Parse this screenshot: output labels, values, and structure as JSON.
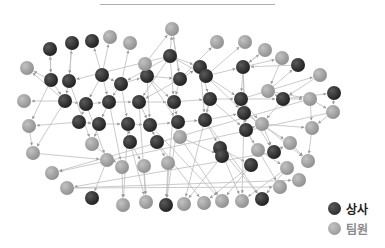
{
  "legend": {
    "items": [
      {
        "label": "상사",
        "color": "#2e2e2e"
      },
      {
        "label": "팀원",
        "color": "#a3a3a3"
      }
    ]
  },
  "colors": {
    "boss": "#2e2e2e",
    "team": "#a3a3a3",
    "edge": "#bdbdbd",
    "rule": "#b0b0b0"
  },
  "graph": {
    "node_radius": 7,
    "nodes": [
      {
        "x": 50,
        "y": 49,
        "t": "boss"
      },
      {
        "x": 72,
        "y": 43,
        "t": "boss"
      },
      {
        "x": 92,
        "y": 41,
        "t": "boss"
      },
      {
        "x": 110,
        "y": 37,
        "t": "team"
      },
      {
        "x": 130,
        "y": 43,
        "t": "team"
      },
      {
        "x": 172,
        "y": 29,
        "t": "team"
      },
      {
        "x": 217,
        "y": 42,
        "t": "team"
      },
      {
        "x": 245,
        "y": 42,
        "t": "team"
      },
      {
        "x": 265,
        "y": 50,
        "t": "team"
      },
      {
        "x": 282,
        "y": 58,
        "t": "team"
      },
      {
        "x": 298,
        "y": 65,
        "t": "boss"
      },
      {
        "x": 170,
        "y": 56,
        "t": "boss"
      },
      {
        "x": 27,
        "y": 68,
        "t": "team"
      },
      {
        "x": 51,
        "y": 80,
        "t": "boss"
      },
      {
        "x": 69,
        "y": 81,
        "t": "boss"
      },
      {
        "x": 102,
        "y": 75,
        "t": "boss"
      },
      {
        "x": 121,
        "y": 84,
        "t": "boss"
      },
      {
        "x": 147,
        "y": 76,
        "t": "boss"
      },
      {
        "x": 145,
        "y": 64,
        "t": "team"
      },
      {
        "x": 180,
        "y": 79,
        "t": "boss"
      },
      {
        "x": 200,
        "y": 67,
        "t": "boss"
      },
      {
        "x": 206,
        "y": 76,
        "t": "boss"
      },
      {
        "x": 243,
        "y": 67,
        "t": "boss"
      },
      {
        "x": 320,
        "y": 75,
        "t": "team"
      },
      {
        "x": 334,
        "y": 93,
        "t": "boss"
      },
      {
        "x": 24,
        "y": 101,
        "t": "team"
      },
      {
        "x": 65,
        "y": 101,
        "t": "boss"
      },
      {
        "x": 86,
        "y": 104,
        "t": "boss"
      },
      {
        "x": 109,
        "y": 102,
        "t": "boss"
      },
      {
        "x": 139,
        "y": 102,
        "t": "boss"
      },
      {
        "x": 174,
        "y": 102,
        "t": "boss"
      },
      {
        "x": 210,
        "y": 99,
        "t": "boss"
      },
      {
        "x": 241,
        "y": 99,
        "t": "boss"
      },
      {
        "x": 268,
        "y": 91,
        "t": "team"
      },
      {
        "x": 283,
        "y": 99,
        "t": "boss"
      },
      {
        "x": 310,
        "y": 99,
        "t": "team"
      },
      {
        "x": 333,
        "y": 112,
        "t": "team"
      },
      {
        "x": 29,
        "y": 126,
        "t": "team"
      },
      {
        "x": 79,
        "y": 122,
        "t": "boss"
      },
      {
        "x": 99,
        "y": 124,
        "t": "boss"
      },
      {
        "x": 128,
        "y": 124,
        "t": "boss"
      },
      {
        "x": 150,
        "y": 125,
        "t": "boss"
      },
      {
        "x": 178,
        "y": 122,
        "t": "boss"
      },
      {
        "x": 205,
        "y": 120,
        "t": "boss"
      },
      {
        "x": 244,
        "y": 113,
        "t": "boss"
      },
      {
        "x": 246,
        "y": 130,
        "t": "boss"
      },
      {
        "x": 262,
        "y": 124,
        "t": "team"
      },
      {
        "x": 312,
        "y": 128,
        "t": "team"
      },
      {
        "x": 33,
        "y": 153,
        "t": "team"
      },
      {
        "x": 92,
        "y": 144,
        "t": "team"
      },
      {
        "x": 130,
        "y": 142,
        "t": "boss"
      },
      {
        "x": 157,
        "y": 142,
        "t": "boss"
      },
      {
        "x": 180,
        "y": 137,
        "t": "team"
      },
      {
        "x": 220,
        "y": 148,
        "t": "boss"
      },
      {
        "x": 258,
        "y": 150,
        "t": "team"
      },
      {
        "x": 274,
        "y": 152,
        "t": "boss"
      },
      {
        "x": 290,
        "y": 143,
        "t": "team"
      },
      {
        "x": 308,
        "y": 161,
        "t": "team"
      },
      {
        "x": 52,
        "y": 173,
        "t": "team"
      },
      {
        "x": 107,
        "y": 160,
        "t": "team"
      },
      {
        "x": 122,
        "y": 167,
        "t": "team"
      },
      {
        "x": 144,
        "y": 166,
        "t": "team"
      },
      {
        "x": 168,
        "y": 163,
        "t": "team"
      },
      {
        "x": 222,
        "y": 156,
        "t": "boss"
      },
      {
        "x": 251,
        "y": 165,
        "t": "boss"
      },
      {
        "x": 287,
        "y": 168,
        "t": "team"
      },
      {
        "x": 67,
        "y": 188,
        "t": "team"
      },
      {
        "x": 92,
        "y": 198,
        "t": "boss"
      },
      {
        "x": 123,
        "y": 205,
        "t": "team"
      },
      {
        "x": 146,
        "y": 202,
        "t": "team"
      },
      {
        "x": 166,
        "y": 205,
        "t": "boss"
      },
      {
        "x": 184,
        "y": 204,
        "t": "team"
      },
      {
        "x": 204,
        "y": 203,
        "t": "team"
      },
      {
        "x": 222,
        "y": 201,
        "t": "team"
      },
      {
        "x": 242,
        "y": 201,
        "t": "team"
      },
      {
        "x": 262,
        "y": 199,
        "t": "boss"
      },
      {
        "x": 280,
        "y": 187,
        "t": "team"
      },
      {
        "x": 299,
        "y": 180,
        "t": "team"
      }
    ],
    "edges": [
      [
        13,
        0
      ],
      [
        14,
        1
      ],
      [
        15,
        2
      ],
      [
        15,
        3
      ],
      [
        16,
        4
      ],
      [
        11,
        5
      ],
      [
        19,
        5
      ],
      [
        18,
        5
      ],
      [
        11,
        14
      ],
      [
        19,
        6
      ],
      [
        21,
        7
      ],
      [
        22,
        8
      ],
      [
        22,
        9
      ],
      [
        33,
        10
      ],
      [
        13,
        12
      ],
      [
        26,
        12
      ],
      [
        15,
        16
      ],
      [
        16,
        17
      ],
      [
        17,
        19
      ],
      [
        19,
        20
      ],
      [
        20,
        21
      ],
      [
        21,
        22
      ],
      [
        22,
        32
      ],
      [
        32,
        23
      ],
      [
        34,
        24
      ],
      [
        34,
        33
      ],
      [
        26,
        25
      ],
      [
        26,
        27
      ],
      [
        27,
        28
      ],
      [
        28,
        29
      ],
      [
        29,
        30
      ],
      [
        30,
        31
      ],
      [
        31,
        32
      ],
      [
        32,
        34
      ],
      [
        34,
        35
      ],
      [
        35,
        36
      ],
      [
        38,
        37
      ],
      [
        38,
        39
      ],
      [
        39,
        40
      ],
      [
        40,
        41
      ],
      [
        41,
        42
      ],
      [
        42,
        43
      ],
      [
        43,
        44
      ],
      [
        44,
        45
      ],
      [
        45,
        46
      ],
      [
        46,
        47
      ],
      [
        37,
        48
      ],
      [
        48,
        59
      ],
      [
        39,
        49
      ],
      [
        40,
        50
      ],
      [
        41,
        51
      ],
      [
        42,
        52
      ],
      [
        43,
        53
      ],
      [
        45,
        54
      ],
      [
        46,
        55
      ],
      [
        55,
        56
      ],
      [
        56,
        57
      ],
      [
        49,
        60
      ],
      [
        50,
        61
      ],
      [
        51,
        62
      ],
      [
        52,
        63
      ],
      [
        53,
        64
      ],
      [
        54,
        65
      ],
      [
        55,
        66
      ],
      [
        59,
        67
      ],
      [
        60,
        68
      ],
      [
        61,
        69
      ],
      [
        62,
        70
      ],
      [
        63,
        71
      ],
      [
        64,
        72
      ],
      [
        64,
        73
      ],
      [
        65,
        74
      ],
      [
        65,
        75
      ],
      [
        66,
        76
      ],
      [
        66,
        77
      ],
      [
        57,
        78
      ],
      [
        11,
        29
      ],
      [
        11,
        30
      ],
      [
        19,
        30
      ],
      [
        15,
        27
      ],
      [
        16,
        40
      ],
      [
        17,
        41
      ],
      [
        17,
        42
      ],
      [
        20,
        43
      ],
      [
        21,
        44
      ],
      [
        22,
        44
      ],
      [
        31,
        45
      ],
      [
        32,
        46
      ],
      [
        15,
        28
      ],
      [
        27,
        38
      ],
      [
        28,
        39
      ],
      [
        29,
        41
      ],
      [
        30,
        42
      ],
      [
        31,
        43
      ],
      [
        36,
        47
      ],
      [
        35,
        47
      ],
      [
        33,
        35
      ],
      [
        13,
        37
      ],
      [
        26,
        48
      ],
      [
        14,
        49
      ],
      [
        27,
        59
      ],
      [
        28,
        60
      ],
      [
        29,
        69
      ],
      [
        30,
        70
      ],
      [
        31,
        71
      ],
      [
        41,
        73
      ],
      [
        43,
        75
      ],
      [
        44,
        74
      ],
      [
        45,
        76
      ],
      [
        42,
        70
      ],
      [
        40,
        68
      ],
      [
        50,
        69
      ],
      [
        51,
        72
      ],
      [
        52,
        73
      ],
      [
        53,
        74
      ],
      [
        53,
        75
      ],
      [
        44,
        56
      ],
      [
        46,
        57
      ],
      [
        47,
        57
      ],
      [
        35,
        58
      ],
      [
        36,
        58
      ],
      [
        11,
        16
      ],
      [
        11,
        20
      ],
      [
        11,
        21
      ],
      [
        5,
        19
      ],
      [
        19,
        29
      ],
      [
        20,
        31
      ],
      [
        21,
        32
      ],
      [
        17,
        30
      ],
      [
        16,
        28
      ],
      [
        14,
        26
      ],
      [
        13,
        26
      ],
      [
        1,
        14
      ],
      [
        0,
        13
      ],
      [
        22,
        45
      ],
      [
        32,
        55
      ],
      [
        34,
        46
      ],
      [
        24,
        36
      ],
      [
        23,
        34
      ],
      [
        10,
        22
      ],
      [
        9,
        33
      ],
      [
        8,
        22
      ]
    ]
  }
}
